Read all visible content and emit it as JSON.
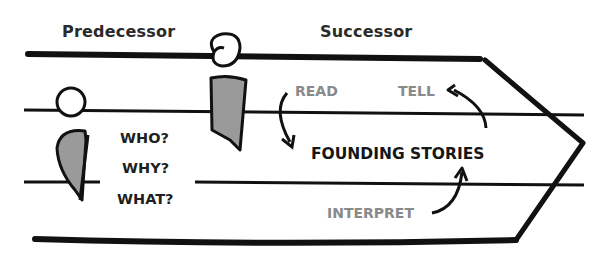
{
  "diagram": {
    "headers": {
      "predecessor": "Predecessor",
      "successor": "Successor"
    },
    "questions": [
      "WHO?",
      "WHY?",
      "WHAT?"
    ],
    "center_label": "FOUNDING STORIES",
    "actions": {
      "read": "READ",
      "tell": "TELL",
      "interpret": "INTERPRET"
    },
    "colors": {
      "stroke": "#111111",
      "figure_fill": "#9a9a9a",
      "action_text": "#8a8a8a"
    }
  }
}
